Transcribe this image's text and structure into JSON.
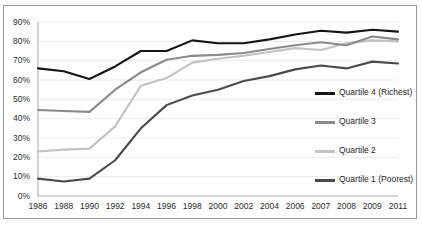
{
  "chart_data": {
    "type": "line",
    "title": "",
    "xlabel": "",
    "ylabel": "",
    "ylim": [
      0,
      90
    ],
    "ytick_labels": [
      "0%",
      "10%",
      "20%",
      "30%",
      "40%",
      "50%",
      "60%",
      "70%",
      "80%",
      "90%"
    ],
    "ytick_values": [
      0,
      10,
      20,
      30,
      40,
      50,
      60,
      70,
      80,
      90
    ],
    "grid": true,
    "grid_axis": "y",
    "legend_position": "right",
    "categories": [
      "1986",
      "1988",
      "1990",
      "1992",
      "1994",
      "1996",
      "1998",
      "2000",
      "2002",
      "2004",
      "2006",
      "2007",
      "2008",
      "2009",
      "2011"
    ],
    "series": [
      {
        "name": "Quartile 4 (Richest)",
        "color": "#151515",
        "values": [
          66,
          64.5,
          60.5,
          67,
          75,
          75,
          80.5,
          79,
          79,
          81,
          83.5,
          85.5,
          84.5,
          86,
          85
        ]
      },
      {
        "name": "Quartile 3",
        "color": "#8a8a8a",
        "values": [
          44.5,
          44,
          43.5,
          55,
          64,
          70.5,
          72.5,
          73,
          74,
          76,
          78,
          79.5,
          78,
          82.5,
          81
        ]
      },
      {
        "name": "Quartile 2",
        "color": "#c2c2c2",
        "values": [
          23,
          24,
          24.5,
          36,
          57,
          61,
          69,
          71,
          72.5,
          74.5,
          76.5,
          75.5,
          79,
          80.5,
          80
        ]
      },
      {
        "name": "Quartile 1 (Poorest)",
        "color": "#4a4a4a",
        "values": [
          9,
          7.5,
          9,
          18.5,
          35,
          47,
          52,
          55,
          59.5,
          62,
          65.5,
          67.5,
          66,
          69.5,
          68.5
        ]
      }
    ]
  },
  "legend": {
    "items": [
      {
        "label": "Quartile 4 (Richest)",
        "color": "#151515"
      },
      {
        "label": "Quartile 3",
        "color": "#8a8a8a"
      },
      {
        "label": "Quartile 2",
        "color": "#c2c2c2"
      },
      {
        "label": "Quartile 1 (Poorest)",
        "color": "#4a4a4a"
      }
    ]
  },
  "axes": {
    "y_labels": [
      "90%",
      "80%",
      "70%",
      "60%",
      "50%",
      "40%",
      "30%",
      "20%",
      "10%",
      "0%"
    ],
    "x_labels": [
      "1986",
      "1988",
      "1990",
      "1992",
      "1994",
      "1996",
      "1998",
      "2000",
      "2002",
      "2004",
      "2006",
      "2007",
      "2008",
      "2009",
      "2011"
    ]
  }
}
